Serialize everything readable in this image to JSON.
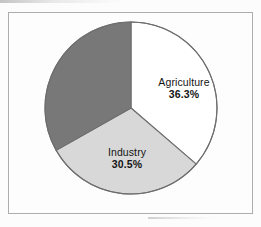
{
  "figure": {
    "background_color": "#fcfcfc",
    "frame_color": "#adadad",
    "frame_fill": "#fdfdfd"
  },
  "chart_data": {
    "type": "pie",
    "title": "",
    "subtitle": "",
    "xlabel": "",
    "ylabel": "",
    "grid": false,
    "legend": "none",
    "units": "percent",
    "start_angle_deg": 0,
    "direction": "clockwise",
    "total": 100.0,
    "categories": [
      "Agriculture",
      "Industry",
      ""
    ],
    "values": [
      36.3,
      30.5,
      33.2
    ],
    "colors": [
      "#ffffff",
      "#d8d8d8",
      "#787878"
    ],
    "edge_color": "#6e6e6e",
    "slices": [
      {
        "name": "Agriculture",
        "value": 36.3,
        "label": "Agriculture",
        "value_label": "36.3%",
        "color": "#ffffff",
        "labeled": true,
        "start_deg": 0.0,
        "end_deg": 130.7
      },
      {
        "name": "Industry",
        "value": 30.5,
        "label": "Industry",
        "value_label": "30.5%",
        "color": "#d8d8d8",
        "labeled": true,
        "start_deg": 130.7,
        "end_deg": 240.5
      },
      {
        "name": "unlabeled-slice",
        "value": 33.2,
        "label": "",
        "value_label": "",
        "color": "#787878",
        "labeled": false,
        "start_deg": 240.5,
        "end_deg": 360.0
      }
    ],
    "geometry": {
      "center_x": 131,
      "center_y": 108,
      "radius": 86
    }
  }
}
